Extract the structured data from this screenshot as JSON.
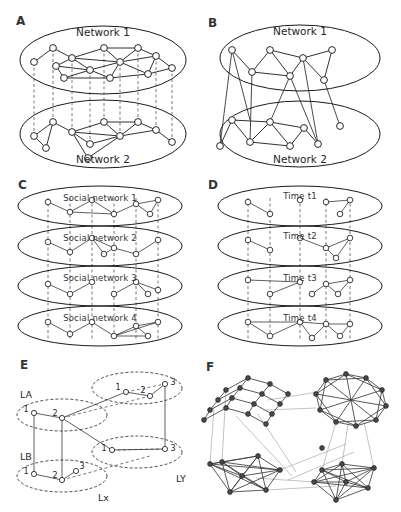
{
  "figure": {
    "background": "#ffffff",
    "width": 401,
    "height": 512
  },
  "panels": [
    {
      "id": "A",
      "letter": "A",
      "type": "two-layer-interconnected-directed",
      "description": "Two network layers with directed intra-layer edges and dashed vertical inter-layer couplings",
      "layer_labels": [
        "Network 1",
        "Network 2"
      ],
      "edge_style": "directed",
      "interlayer_style": "dashed-vertical"
    },
    {
      "id": "B",
      "letter": "B",
      "type": "two-layer-interconnected-undirected",
      "description": "Two network layers with undirected intra-layer edges and solid diagonal inter-layer edges",
      "layer_labels": [
        "Network 1",
        "Network 2"
      ],
      "edge_style": "undirected",
      "interlayer_style": "solid-diagonal"
    },
    {
      "id": "C",
      "letter": "C",
      "type": "multiplex-social",
      "description": "Four stacked social network layers sharing the same node set, linked by dashed vertical lines",
      "layer_labels": [
        "Social network 1",
        "Social network 2",
        "Social network 3",
        "Social network 4"
      ],
      "edge_style": "undirected",
      "interlayer_style": "dashed-vertical"
    },
    {
      "id": "D",
      "letter": "D",
      "type": "temporal-network",
      "description": "Four time-ordered snapshots of the same network, linked by dashed vertical lines",
      "layer_labels": [
        "Time t1",
        "Time t2",
        "Time t3",
        "Time t4"
      ],
      "edge_style": "undirected",
      "interlayer_style": "dashed-vertical"
    },
    {
      "id": "E",
      "letter": "E",
      "type": "network-of-networks",
      "description": "Four small labelled layers with numbered nodes and cross-layer couplings",
      "layer_labels": [
        "LA",
        "LB",
        "Lx",
        "LY"
      ],
      "node_labels": {
        "LA": [
          "1",
          "2"
        ],
        "LB": [
          "1",
          "2",
          "3"
        ],
        "upper_right": [
          "1",
          "2",
          "3"
        ],
        "lower_right": [
          "1",
          "3"
        ]
      },
      "edge_style": "undirected",
      "interlayer_style": "mixed-solid-dashed"
    },
    {
      "id": "F",
      "letter": "F",
      "type": "interconnected-communities",
      "description": "Four dense network modules — a lattice grid, a circulant ring and two dense clusters — joined by sparse inter-module links",
      "layer_labels": [],
      "edge_style": "undirected",
      "interlayer_style": "sparse-light"
    }
  ],
  "colors": {
    "ink": "#1a1a1a",
    "node_fill": "#ffffff",
    "node_fill_dense": "#4a4a4a",
    "dashed": "#555555",
    "light_edge": "#9a9a9a",
    "background": "#ffffff"
  }
}
